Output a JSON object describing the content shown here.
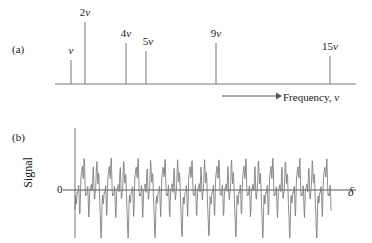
{
  "figure": {
    "panel_a_tag": "(a)",
    "panel_b_tag": "(b)",
    "line_color": "#6e6e6e",
    "axis_color": "#555555",
    "text_color": "#1a1a1a"
  },
  "panel_a": {
    "caption_prefix": "Frequency, ",
    "caption_symbol": "ν",
    "axis": {
      "x_start": 55,
      "x_end": 356,
      "baseline_y": 84
    },
    "arrow": {
      "x_start": 222,
      "x_end": 279,
      "y": 96
    }
  },
  "panel_b": {
    "y_axis_label": "Signal",
    "zero_label": "0",
    "x_axis_symbol": "δ",
    "zero_line_y": 190,
    "plot_x_start": 75,
    "plot_x_end": 331,
    "zero_line_x_end": 356,
    "vertical_axis_x": 75,
    "vertical_axis_top": 128,
    "vertical_axis_bottom": 238
  },
  "chart_data": {
    "type": "bar",
    "title": "",
    "subtitle": "",
    "xlabel": "Frequency, ν",
    "ylabel": "",
    "grid": false,
    "legend": "none",
    "categories": [
      "ν",
      "2ν",
      "4ν",
      "5ν",
      "9ν",
      "15ν"
    ],
    "harmonics": [
      1,
      2,
      4,
      5,
      9,
      15
    ],
    "values": [
      0.42,
      1.0,
      0.72,
      0.55,
      0.72,
      0.4
    ],
    "xlim": [
      0,
      16
    ],
    "ylim": [
      0,
      1.05
    ],
    "sticks": [
      {
        "label": "ν",
        "harmonic": 1,
        "x": 71,
        "amplitude": 0.42,
        "top_y": 60,
        "label_x": 71,
        "label_y": 44
      },
      {
        "label": "2ν",
        "harmonic": 2,
        "x": 85,
        "amplitude": 1.0,
        "top_y": 22,
        "label_x": 85,
        "label_y": 6
      },
      {
        "label": "4ν",
        "harmonic": 4,
        "x": 126,
        "amplitude": 0.72,
        "top_y": 43,
        "label_x": 126,
        "label_y": 27
      },
      {
        "label": "5ν",
        "harmonic": 5,
        "x": 146,
        "amplitude": 0.55,
        "top_y": 51,
        "label_x": 148,
        "label_y": 35
      },
      {
        "label": "9ν",
        "harmonic": 9,
        "x": 216,
        "amplitude": 0.72,
        "top_y": 43,
        "label_x": 216,
        "label_y": 27
      },
      {
        "label": "15ν",
        "harmonic": 15,
        "x": 330,
        "amplitude": 0.4,
        "top_y": 56,
        "label_x": 330,
        "label_y": 40
      }
    ],
    "interferogram": {
      "type": "line",
      "description": "Sum of cosine components at the spectral harmonics",
      "xlabel": "δ",
      "ylabel": "Signal",
      "components": [
        {
          "harmonic": 1,
          "amplitude": 0.42
        },
        {
          "harmonic": 2,
          "amplitude": 1.0
        },
        {
          "harmonic": 4,
          "amplitude": 0.72
        },
        {
          "harmonic": 5,
          "amplitude": 0.55
        },
        {
          "harmonic": 9,
          "amplitude": 0.72
        },
        {
          "harmonic": 15,
          "amplitude": 0.4
        }
      ],
      "cycles": 9.5,
      "samples": 560,
      "y_scale_px": 55
    }
  }
}
